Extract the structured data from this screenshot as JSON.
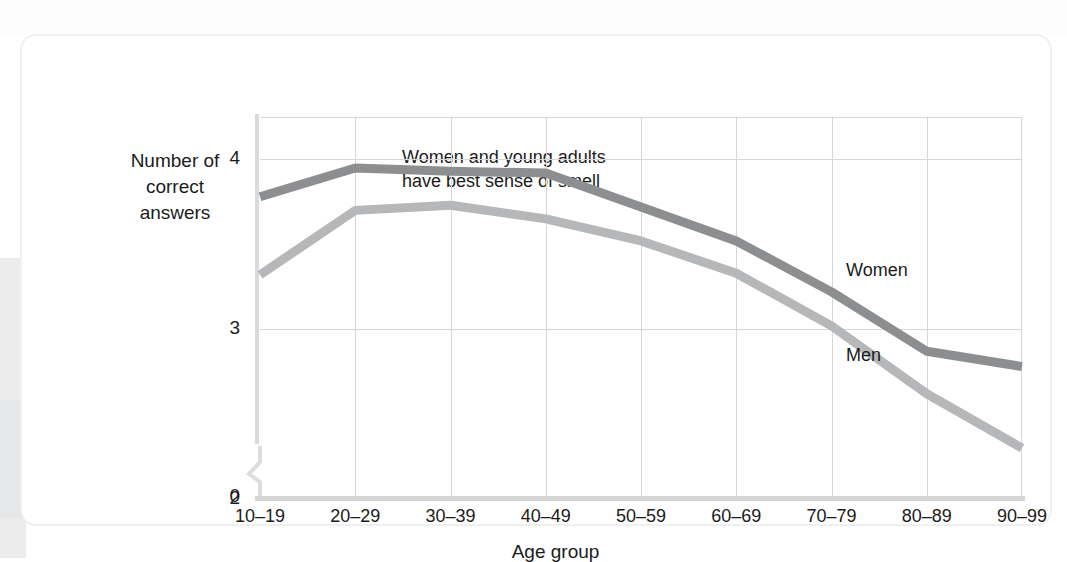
{
  "chart_data": {
    "type": "line",
    "title": "",
    "annotation": "Women and young adults\nhave best sense of smell",
    "annotation_line1": "Women and young adults",
    "annotation_line2": "have best sense of smell",
    "xlabel": "Age group",
    "ylabel": "Number of correct answers",
    "ylabel_line1": "Number of",
    "ylabel_line2": "correct answers",
    "categories": [
      "10–19",
      "20–29",
      "30–39",
      "40–49",
      "50–59",
      "60–69",
      "70–79",
      "80–89",
      "90–99"
    ],
    "yticks": [
      "4",
      "3",
      "2",
      "0"
    ],
    "ylim": [
      2,
      4.25
    ],
    "y_axis_break": true,
    "grid": true,
    "legend_position": "inline-right",
    "series": [
      {
        "name": "Women",
        "color": "#8d8e90",
        "values": [
          3.78,
          3.95,
          3.93,
          3.92,
          3.72,
          3.52,
          3.22,
          2.87,
          2.78
        ]
      },
      {
        "name": "Men",
        "color": "#b6b7b9",
        "values": [
          3.32,
          3.7,
          3.73,
          3.65,
          3.52,
          3.33,
          3.02,
          2.62,
          2.3
        ]
      }
    ]
  },
  "figure": {
    "background_color": "#ffffff",
    "grid_color": "#d6d7d8",
    "axis_color": "#d3d4d5",
    "text_color": "#1b1b1b"
  }
}
